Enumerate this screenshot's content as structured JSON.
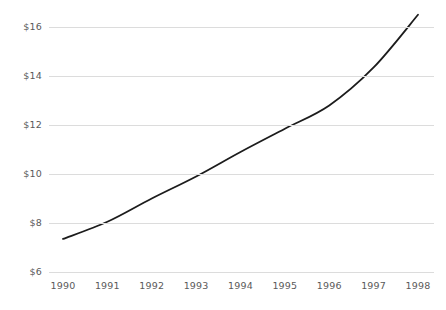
{
  "chart_data": {
    "type": "line",
    "title": "",
    "subtitle": "",
    "xlabel": "",
    "ylabel": "",
    "categories": [
      "1990",
      "1991",
      "1992",
      "1993",
      "1994",
      "1995",
      "1996",
      "1997",
      "1998"
    ],
    "x": [
      1990,
      1991,
      1992,
      1993,
      1994,
      1995,
      1996,
      1997,
      1998
    ],
    "values": [
      7.35,
      8.05,
      9.0,
      9.9,
      10.9,
      11.85,
      12.8,
      14.35,
      16.5
    ],
    "series": [
      {
        "name": "",
        "values": [
          7.35,
          8.05,
          9.0,
          9.9,
          10.9,
          11.85,
          12.8,
          14.35,
          16.5
        ]
      }
    ],
    "ylim": [
      6,
      16.5
    ],
    "xlim": [
      1990,
      1998
    ],
    "y_ticks": [
      6,
      8,
      10,
      12,
      14,
      16
    ],
    "y_tick_labels": [
      "$6",
      "$8",
      "$10",
      "$12",
      "$14",
      "$16"
    ],
    "x_tick_labels": [
      "1990",
      "1991",
      "1992",
      "1993",
      "1994",
      "1995",
      "1996",
      "1997",
      "1998"
    ],
    "grid": "horizontal",
    "legend": "none",
    "annotations": [],
    "colors": {
      "line": "#1c1c1c",
      "grid": "#dcdcdc",
      "tick_label": "#5a5a5a",
      "background": "#ffffff"
    },
    "line_width": 1.8,
    "smoothing": "monotone-spline"
  }
}
